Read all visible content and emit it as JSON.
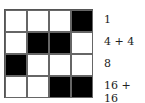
{
  "grid": {
    "rows": [
      [
        0,
        0,
        0,
        1
      ],
      [
        0,
        1,
        1,
        0
      ],
      [
        1,
        0,
        0,
        0
      ],
      [
        0,
        0,
        1,
        1
      ]
    ],
    "colors": {
      "filled": "#000000",
      "empty": "#ffffff"
    }
  },
  "labels": [
    "1",
    "4 + 4",
    "8",
    "16 + 16"
  ]
}
